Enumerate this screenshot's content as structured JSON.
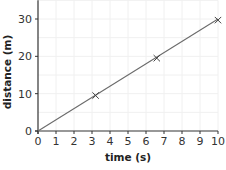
{
  "chart_data": {
    "type": "line",
    "title": "",
    "xlabel": "time (s)",
    "ylabel": "distance (m)",
    "xlim": [
      0,
      10
    ],
    "ylim": [
      0,
      35
    ],
    "x_ticks": [
      0,
      1,
      2,
      3,
      4,
      5,
      6,
      7,
      8,
      9,
      10
    ],
    "y_ticks": [
      0,
      10,
      20,
      30
    ],
    "grid": true,
    "series": [
      {
        "name": "distance vs time",
        "line": {
          "x": [
            0,
            10
          ],
          "y": [
            0,
            30
          ]
        },
        "markers": {
          "x": [
            3.2,
            6.6,
            10
          ],
          "y": [
            9.5,
            19.5,
            29.7
          ],
          "marker": "x"
        }
      }
    ]
  },
  "colors": {
    "line": "#6b6b6b",
    "axis": "#333333",
    "grid": "#f0f0f0"
  }
}
